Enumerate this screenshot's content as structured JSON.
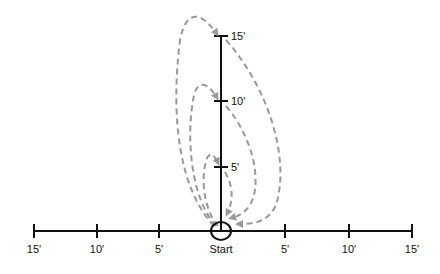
{
  "diagram": {
    "title": "",
    "origin_label": "Start",
    "horizontal_axis": {
      "left_labels": [
        "15'",
        "10'",
        "5'"
      ],
      "right_labels": [
        "5'",
        "10'",
        "15'"
      ]
    },
    "vertical_axis": {
      "labels": [
        "5'",
        "10'",
        "15'"
      ]
    },
    "paths": [
      {
        "name": "loop-to-5ft",
        "target": "5'",
        "style": "dashed",
        "color": "#999999"
      },
      {
        "name": "loop-to-10ft",
        "target": "10'",
        "style": "dashed",
        "color": "#999999"
      },
      {
        "name": "loop-to-15ft",
        "target": "15'",
        "style": "dashed",
        "color": "#999999"
      }
    ],
    "colors": {
      "axis": "#111111",
      "path": "#999999"
    }
  }
}
